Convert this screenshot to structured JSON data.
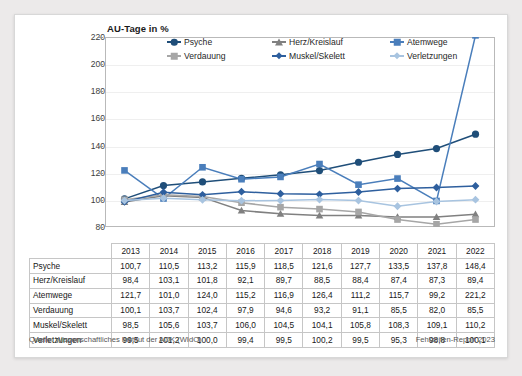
{
  "card": {
    "axis_title": "AU-Tage in %"
  },
  "footer": {
    "source": "Quelle: Wissenschaftliches Institut der AOK (WIdO)",
    "report": "Fehlzeiten-Report 2023"
  },
  "legend": {
    "items": [
      {
        "label": "Psyche",
        "marker": "circle",
        "color": "#1f4e79"
      },
      {
        "label": "Herz/Kreislauf",
        "marker": "triangle",
        "color": "#808080"
      },
      {
        "label": "Atemwege",
        "marker": "square",
        "color": "#4a7ebb"
      },
      {
        "label": "Verdauung",
        "marker": "square",
        "color": "#a6a6a6"
      },
      {
        "label": "Muskel/Skelett",
        "marker": "diamond",
        "color": "#2e5f9e"
      },
      {
        "label": "Verletzungen",
        "marker": "diamond",
        "color": "#a8c4e0"
      }
    ]
  },
  "chart_data": {
    "type": "line",
    "title": "AU-Tage in %",
    "xlabel": "",
    "ylabel": "AU-Tage in %",
    "ylim": [
      80,
      220
    ],
    "yticks": [
      80,
      100,
      120,
      140,
      160,
      180,
      200,
      220
    ],
    "grid": true,
    "legend_position": "top-inside",
    "categories": [
      "2013",
      "2014",
      "2015",
      "2016",
      "2017",
      "2018",
      "2019",
      "2020",
      "2021",
      "2022"
    ],
    "series": [
      {
        "name": "Psyche",
        "color": "#1f4e79",
        "marker": "circle",
        "values": [
          100.7,
          110.5,
          113.2,
          115.9,
          118.5,
          121.6,
          127.7,
          133.5,
          137.8,
          148.4
        ]
      },
      {
        "name": "Herz/Kreislauf",
        "color": "#808080",
        "marker": "triangle",
        "values": [
          98.4,
          103.1,
          101.8,
          92.1,
          89.7,
          88.5,
          88.4,
          87.4,
          87.3,
          89.4
        ]
      },
      {
        "name": "Atemwege",
        "color": "#4a7ebb",
        "marker": "square",
        "values": [
          121.7,
          101.0,
          124.0,
          115.2,
          116.9,
          126.4,
          111.2,
          115.7,
          99.2,
          221.2
        ]
      },
      {
        "name": "Verdauung",
        "color": "#a6a6a6",
        "marker": "square",
        "values": [
          100.1,
          103.7,
          102.4,
          97.9,
          94.6,
          93.2,
          91.1,
          85.5,
          82.0,
          85.5
        ]
      },
      {
        "name": "Muskel/Skelett",
        "color": "#2e5f9e",
        "marker": "diamond",
        "values": [
          98.5,
          105.6,
          103.7,
          106.0,
          104.5,
          104.1,
          105.8,
          108.3,
          109.1,
          110.2
        ]
      },
      {
        "name": "Verletzungen",
        "color": "#a8c4e0",
        "marker": "diamond",
        "values": [
          99.5,
          101.2,
          100.0,
          99.4,
          99.5,
          100.2,
          99.5,
          95.3,
          98.8,
          100.1
        ]
      }
    ]
  },
  "table": {
    "corner": "",
    "columns": [
      "2013",
      "2014",
      "2015",
      "2016",
      "2017",
      "2018",
      "2019",
      "2020",
      "2021",
      "2022"
    ],
    "rows": [
      {
        "label": "Psyche",
        "values": [
          "100,7",
          "110,5",
          "113,2",
          "115,9",
          "118,5",
          "121,6",
          "127,7",
          "133,5",
          "137,8",
          "148,4"
        ]
      },
      {
        "label": "Herz/Kreislauf",
        "values": [
          "98,4",
          "103,1",
          "101,8",
          "92,1",
          "89,7",
          "88,5",
          "88,4",
          "87,4",
          "87,3",
          "89,4"
        ]
      },
      {
        "label": "Atemwege",
        "values": [
          "121,7",
          "101,0",
          "124,0",
          "115,2",
          "116,9",
          "126,4",
          "111,2",
          "115,7",
          "99,2",
          "221,2"
        ]
      },
      {
        "label": "Verdauung",
        "values": [
          "100,1",
          "103,7",
          "102,4",
          "97,9",
          "94,6",
          "93,2",
          "91,1",
          "85,5",
          "82,0",
          "85,5"
        ]
      },
      {
        "label": "Muskel/Skelett",
        "values": [
          "98,5",
          "105,6",
          "103,7",
          "106,0",
          "104,5",
          "104,1",
          "105,8",
          "108,3",
          "109,1",
          "110,2"
        ]
      },
      {
        "label": "Verletzungen",
        "values": [
          "99,5",
          "101,2",
          "100,0",
          "99,4",
          "99,5",
          "100,2",
          "99,5",
          "95,3",
          "98,8",
          "100,1"
        ]
      }
    ]
  }
}
